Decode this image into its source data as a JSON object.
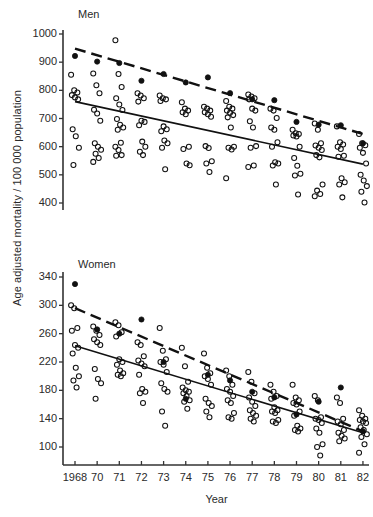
{
  "figure": {
    "ylabel": "Age adjusted mortality / 100 000 population",
    "xlabel": "Year"
  },
  "panels": {
    "men": {
      "title": "Men"
    },
    "women": {
      "title": "Women"
    }
  },
  "chart_data": [
    {
      "type": "scatter",
      "title": "Men",
      "xlabel": "Year",
      "ylabel": "Age adjusted mortality / 100 000 population",
      "grid": false,
      "legend": "none",
      "categories": [
        "1968",
        "70",
        "71",
        "72",
        "73",
        "74",
        "75",
        "76",
        "77",
        "78",
        "79",
        "80",
        "81",
        "82"
      ],
      "ylim": [
        380,
        1010
      ],
      "yticks": [
        400,
        500,
        600,
        700,
        800,
        900,
        1000
      ],
      "series": [
        {
          "name": "filled-circle-marker",
          "marker": "filled-circle",
          "x": [
            "1968",
            "70",
            "71",
            "72",
            "73",
            "74",
            "75",
            "76",
            "77",
            "78",
            "79",
            "80",
            "81",
            "82"
          ],
          "values": [
            922,
            902,
            897,
            834,
            858,
            828,
            846,
            790,
            768,
            765,
            688,
            678,
            676,
            612
          ]
        },
        {
          "name": "open-circle-observations",
          "marker": "open-circle",
          "points": [
            {
              "x": "1968",
              "y": [
                855,
                800,
                792,
                783,
                775,
                768,
                662,
                637,
                596,
                535
              ]
            },
            {
              "x": "70",
              "y": [
                860,
                818,
                790,
                731,
                718,
                692,
                612,
                600,
                589,
                575,
                560,
                546
              ]
            },
            {
              "x": "71",
              "y": [
                978,
                858,
                812,
                772,
                750,
                730,
                698,
                678,
                668,
                660,
                614,
                600,
                588,
                570,
                568
              ]
            },
            {
              "x": "72",
              "y": [
                790,
                782,
                772,
                760,
                692,
                688,
                676,
                618,
                600,
                582,
                570
              ]
            },
            {
              "x": "73",
              "y": [
                782,
                772,
                768,
                762,
                672,
                662,
                655,
                622,
                612,
                596,
                520
              ]
            },
            {
              "x": "74",
              "y": [
                758,
                735,
                728,
                722,
                715,
                600,
                592,
                540,
                534
              ]
            },
            {
              "x": "75",
              "y": [
                742,
                735,
                728,
                722,
                715,
                706,
                602,
                595,
                548,
                540,
                510
              ]
            },
            {
              "x": "76",
              "y": [
                762,
                742,
                735,
                728,
                720,
                712,
                704,
                668,
                600,
                596,
                590,
                488
              ]
            },
            {
              "x": "77",
              "y": [
                785,
                778,
                772,
                768,
                735,
                728,
                690,
                668,
                602,
                596,
                533,
                528
              ]
            },
            {
              "x": "78",
              "y": [
                735,
                728,
                702,
                668,
                660,
                616,
                600,
                545,
                540,
                533,
                466
              ]
            },
            {
              "x": "79",
              "y": [
                660,
                648,
                645,
                640,
                636,
                600,
                560,
                532,
                504,
                498,
                430
              ]
            },
            {
              "x": "80",
              "y": [
                682,
                660,
                612,
                604,
                596,
                588,
                570,
                562,
                466,
                444,
                432,
                424
              ]
            },
            {
              "x": "81",
              "y": [
                672,
                616,
                608,
                600,
                592,
                568,
                564,
                488,
                474,
                466,
                420
              ]
            },
            {
              "x": "82",
              "y": [
                645,
                612,
                605,
                596,
                578,
                540,
                500,
                480,
                460,
                440,
                402
              ]
            }
          ]
        }
      ],
      "trendlines": [
        {
          "name": "dashed-trendline",
          "style": "dashed",
          "x0": "1968",
          "y0": 948,
          "x1": "82",
          "y1": 645
        },
        {
          "name": "solid-trendline",
          "style": "solid",
          "x0": "1968",
          "y0": 760,
          "x1": "82",
          "y1": 538
        }
      ]
    },
    {
      "type": "scatter",
      "title": "Women",
      "xlabel": "Year",
      "ylabel": "Age adjusted mortality / 100 000 population",
      "grid": false,
      "legend": "none",
      "categories": [
        "1968",
        "70",
        "71",
        "72",
        "73",
        "74",
        "75",
        "76",
        "77",
        "78",
        "79",
        "80",
        "81",
        "82"
      ],
      "ylim": [
        78,
        352
      ],
      "yticks": [
        100,
        140,
        180,
        220,
        260,
        300,
        340
      ],
      "series": [
        {
          "name": "filled-circle-marker",
          "marker": "filled-circle",
          "x": [
            "1968",
            "70",
            "71",
            "72",
            "73",
            "74",
            "75",
            "76",
            "77",
            "78",
            "79",
            "80",
            "81",
            "82"
          ],
          "values": [
            330,
            266,
            260,
            280,
            220,
            168,
            202,
            194,
            178,
            170,
            146,
            164,
            184,
            122
          ]
        },
        {
          "name": "open-circle-observations",
          "marker": "open-circle",
          "points": [
            {
              "x": "1968",
              "y": [
                300,
                296,
                268,
                264,
                244,
                240,
                232,
                212,
                200,
                194,
                184
              ]
            },
            {
              "x": "70",
              "y": [
                270,
                264,
                258,
                252,
                248,
                244,
                210,
                196,
                190,
                168
              ]
            },
            {
              "x": "71",
              "y": [
                276,
                272,
                262,
                256,
                224,
                220,
                216,
                208,
                204,
                202,
                200
              ]
            },
            {
              "x": "72",
              "y": [
                248,
                244,
                228,
                222,
                218,
                214,
                202,
                182,
                178,
                176,
                162
              ]
            },
            {
              "x": "73",
              "y": [
                268,
                236,
                224,
                220,
                216,
                206,
                190,
                182,
                178,
                150,
                130
              ]
            },
            {
              "x": "74",
              "y": [
                240,
                214,
                192,
                184,
                180,
                178,
                176,
                172,
                166,
                164,
                154
              ]
            },
            {
              "x": "75",
              "y": [
                232,
                212,
                204,
                200,
                196,
                188,
                168,
                162,
                158,
                150,
                142
              ]
            },
            {
              "x": "76",
              "y": [
                208,
                200,
                188,
                182,
                178,
                172,
                166,
                162,
                148,
                142,
                140
              ]
            },
            {
              "x": "77",
              "y": [
                206,
                192,
                176,
                170,
                164,
                158,
                152,
                148,
                144,
                140,
                136
              ]
            },
            {
              "x": "78",
              "y": [
                188,
                178,
                172,
                168,
                156,
                152,
                150,
                148,
                138,
                136,
                134
              ]
            },
            {
              "x": "79",
              "y": [
                188,
                170,
                166,
                162,
                160,
                150,
                144,
                130,
                126,
                124,
                122
              ]
            },
            {
              "x": "80",
              "y": [
                172,
                166,
                142,
                140,
                138,
                134,
                126,
                120,
                104,
                100,
                88
              ]
            },
            {
              "x": "81",
              "y": [
                170,
                162,
                140,
                136,
                132,
                124,
                120,
                116,
                112,
                108
              ]
            },
            {
              "x": "82",
              "y": [
                152,
                144,
                140,
                138,
                136,
                134,
                128,
                124,
                118,
                114,
                104,
                92
              ]
            }
          ]
        }
      ],
      "trendlines": [
        {
          "name": "dashed-trendline",
          "style": "dashed",
          "x0": "1968",
          "y0": 296,
          "x1": "82",
          "y1": 122
        },
        {
          "name": "solid-trendline",
          "style": "solid",
          "x0": "1968",
          "y0": 243,
          "x1": "82",
          "y1": 120
        }
      ]
    }
  ]
}
